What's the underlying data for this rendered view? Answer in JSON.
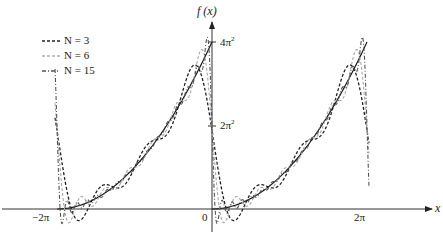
{
  "chart_data": {
    "type": "line",
    "title": "",
    "function": "f(x) = x^2 on (0, 2π), periodic extension; Fourier partial sums S_N",
    "xlabel": "x",
    "ylabel": "f (x)",
    "x_ticks": [
      {
        "value": -6.283185,
        "label": "−2π"
      },
      {
        "value": 0,
        "label": "0"
      },
      {
        "value": 6.283185,
        "label": "2π"
      }
    ],
    "y_ticks": [
      {
        "value": 19.7392,
        "label": "2π²"
      },
      {
        "value": 39.4784,
        "label": "4π²"
      }
    ],
    "xlim": [
      -7.0,
      8.3
    ],
    "ylim": [
      -5,
      47
    ],
    "grid": false,
    "legend_position": "upper-left",
    "fourier": {
      "a0_half": 13.1595,
      "a_n": "4/n^2",
      "b_n": "-4π/n"
    },
    "series": [
      {
        "name": "f(x)",
        "style": "solid",
        "color": "#1a1a1a",
        "N": 0
      },
      {
        "name": "N=3",
        "style": "dashed",
        "color": "#222222",
        "N": 3
      },
      {
        "name": "N=6",
        "style": "dashed-light",
        "color": "#a8a8a8",
        "N": 6
      },
      {
        "name": "N=15",
        "style": "dashdot",
        "color": "#555555",
        "N": 15
      }
    ]
  },
  "labels": {
    "y_axis": "f (x)",
    "x_axis": "x",
    "y_tick_top": "4π",
    "y_tick_top_sup": "2",
    "y_tick_mid": "2π",
    "y_tick_mid_sup": "2",
    "x_tick_left": "−2π",
    "x_tick_origin": "0",
    "x_tick_right": "2π"
  },
  "legend": [
    {
      "label": "N = 3",
      "color": "#222222",
      "dash": "3,2"
    },
    {
      "label": "N = 6",
      "color": "#b0b0b0",
      "dash": "3,2"
    },
    {
      "label": "N = 15",
      "color": "#555555",
      "dash": "4,2,1,2"
    }
  ]
}
